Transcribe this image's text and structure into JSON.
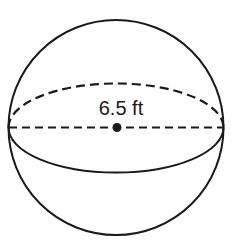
{
  "figure": {
    "type": "sphere",
    "label": "6.5 ft",
    "label_meaning": "radius",
    "stroke_color": "#1a1a1a",
    "background": "#ffffff"
  },
  "geometry": {
    "center": [
      116,
      127.5
    ],
    "radius": 107,
    "equator_ry": 44
  }
}
